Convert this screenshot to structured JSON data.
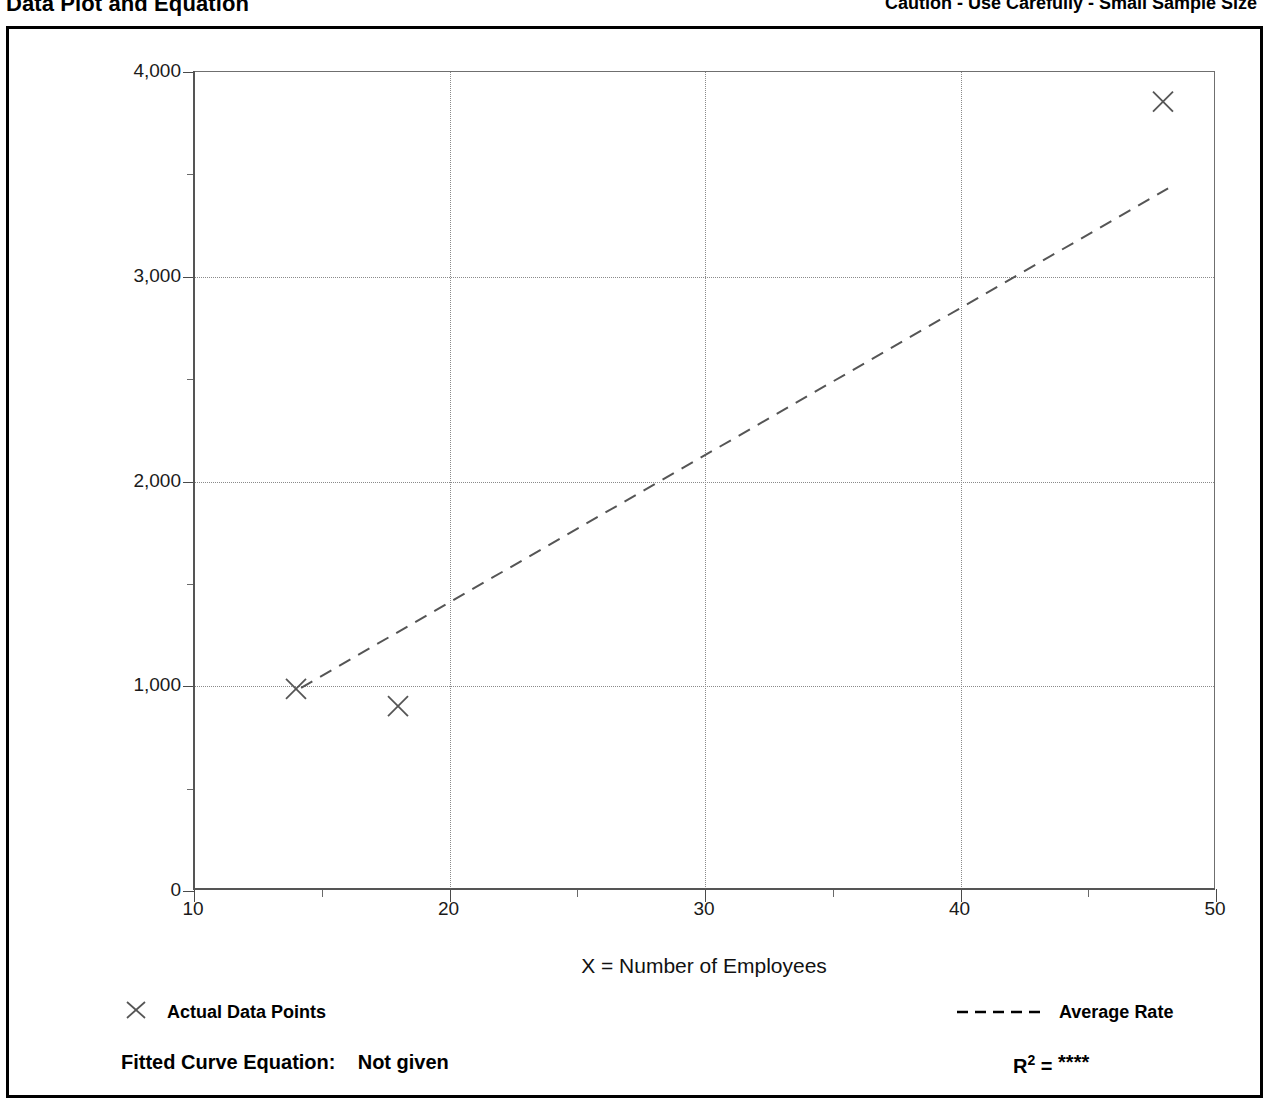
{
  "header": {
    "title": "Data Plot and Equation",
    "caution": "Caution - Use Carefully - Small Sample Size"
  },
  "chart_data": {
    "type": "scatter",
    "title": "Data Plot and Equation",
    "xlabel": "X = Number of Employees",
    "ylabel": "T = Average Vehicle Trip Ends",
    "xlim": [
      10,
      50
    ],
    "ylim": [
      0,
      4000
    ],
    "xticks": [
      10,
      20,
      30,
      40,
      50
    ],
    "xtick_labels": [
      "10",
      "20",
      "30",
      "40",
      "50"
    ],
    "xticks_minor": [
      15,
      25,
      35,
      45
    ],
    "yticks": [
      0,
      1000,
      2000,
      3000,
      4000
    ],
    "ytick_labels": [
      "0",
      "1,000",
      "2,000",
      "3,000",
      "4,000"
    ],
    "yticks_minor": [
      500,
      1500,
      2500,
      3500
    ],
    "grid": true,
    "grid_style": "dotted",
    "legend_position": "below-plot",
    "series": [
      {
        "name": "Actual Data Points",
        "type": "scatter",
        "marker": "x",
        "color": "#555555",
        "points": [
          {
            "x": 14,
            "y": 980
          },
          {
            "x": 18,
            "y": 895
          },
          {
            "x": 48,
            "y": 3855
          }
        ]
      },
      {
        "name": "Average Rate",
        "type": "line",
        "style": "dashed",
        "color": "#555555",
        "points": [
          {
            "x": 14.2,
            "y": 985
          },
          {
            "x": 48.2,
            "y": 3430
          }
        ]
      }
    ]
  },
  "legend": {
    "data_points_label": "Actual Data Points",
    "data_points_marker": "x-marker-icon",
    "average_rate_label": "Average Rate",
    "average_rate_marker": "dashed-line-icon"
  },
  "footer": {
    "equation_label": "Fitted Curve Equation:",
    "equation_value": "Not given",
    "r2_label": "R",
    "r2_exponent": "2",
    "r2_equals": "=",
    "r2_value": "****"
  },
  "colors": {
    "ink": "#000000",
    "grid": "#8a8a8a",
    "axis": "#555555",
    "marker": "#555555"
  }
}
